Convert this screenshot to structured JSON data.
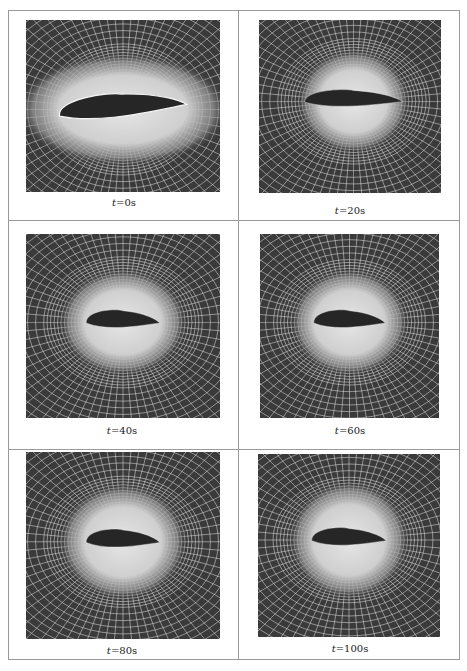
{
  "figure": {
    "panels": [
      {
        "id": "t0",
        "caption": "t=0s",
        "time_s": 0,
        "x": 26,
        "y": 20,
        "w": 194,
        "h": 172,
        "cap_x": 124,
        "cap_y": 197,
        "airfoil": {
          "cx": 0.5,
          "cy": 0.52,
          "len": 0.66,
          "thick": 0.1,
          "tilt": -6
        },
        "light_rx": 0.55,
        "light_ry": 0.33
      },
      {
        "id": "t20",
        "caption": "t=20s",
        "time_s": 20,
        "x": 259,
        "y": 20,
        "w": 182,
        "h": 173,
        "cap_x": 350,
        "cap_y": 205,
        "airfoil": {
          "cx": 0.52,
          "cy": 0.47,
          "len": 0.54,
          "thick": 0.07,
          "tilt": -1
        },
        "light_rx": 0.31,
        "light_ry": 0.3
      },
      {
        "id": "t40",
        "caption": "t=40s",
        "time_s": 40,
        "x": 26,
        "y": 234,
        "w": 194,
        "h": 184,
        "cap_x": 122,
        "cap_y": 425,
        "airfoil": {
          "cx": 0.5,
          "cy": 0.48,
          "len": 0.38,
          "thick": 0.07,
          "tilt": -1
        },
        "light_rx": 0.33,
        "light_ry": 0.29
      },
      {
        "id": "t60",
        "caption": "t=60s",
        "time_s": 60,
        "x": 260,
        "y": 234,
        "w": 179,
        "h": 184,
        "cap_x": 350,
        "cap_y": 425,
        "airfoil": {
          "cx": 0.5,
          "cy": 0.48,
          "len": 0.4,
          "thick": 0.07,
          "tilt": -1
        },
        "light_rx": 0.33,
        "light_ry": 0.29
      },
      {
        "id": "t80",
        "caption": "t=80s",
        "time_s": 80,
        "x": 26,
        "y": 452,
        "w": 194,
        "h": 187,
        "cap_x": 122,
        "cap_y": 645,
        "airfoil": {
          "cx": 0.5,
          "cy": 0.48,
          "len": 0.38,
          "thick": 0.07,
          "tilt": -1
        },
        "light_rx": 0.33,
        "light_ry": 0.31
      },
      {
        "id": "t100",
        "caption": "t=100s",
        "time_s": 100,
        "x": 258,
        "y": 454,
        "w": 182,
        "h": 183,
        "cap_x": 350,
        "cap_y": 643,
        "airfoil": {
          "cx": 0.5,
          "cy": 0.47,
          "len": 0.41,
          "thick": 0.07,
          "tilt": -1
        },
        "light_rx": 0.33,
        "light_ry": 0.32
      }
    ],
    "colors": {
      "background_dark": "#3a3a3a",
      "mesh_lines": "#e8e8e8",
      "light_region": "#cfcfcf",
      "airfoil": "#262626",
      "border": "#9a9a9a"
    }
  }
}
